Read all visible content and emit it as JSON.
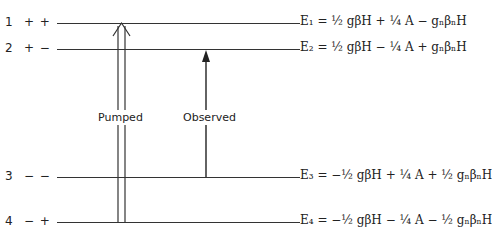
{
  "levels": [
    {
      "num": "1",
      "spins": "+ +",
      "energy": "E₁ = ½ gβH + ¼ A − gₙβₙH"
    },
    {
      "num": "2",
      "spins": "+ −",
      "energy": "E₂ = ½ gβH − ¼ A + gₙβₙH"
    },
    {
      "num": "3",
      "spins": "− −",
      "energy": "E₃ = −½ gβH + ¼ A + ½ gₙβₙH"
    },
    {
      "num": "4",
      "spins": "− +",
      "energy": "E₄ = −½ gβH − ¼ A − ½ gₙβₙH"
    }
  ],
  "transitions": {
    "pumped": "Pumped",
    "observed": "Observed"
  }
}
